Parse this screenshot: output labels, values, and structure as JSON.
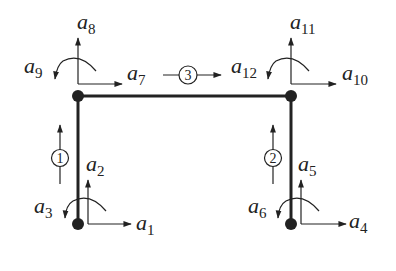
{
  "diagram": {
    "type": "plane frame degrees of freedom",
    "colors": {
      "stroke": "#222222",
      "background": "#ffffff"
    },
    "nodes": [
      {
        "id": "n1",
        "position": "bottom-left"
      },
      {
        "id": "n2",
        "position": "bottom-right"
      },
      {
        "id": "n3",
        "position": "top-left"
      },
      {
        "id": "n4",
        "position": "top-right"
      }
    ],
    "members": [
      {
        "number": "1",
        "from": "n1",
        "to": "n3",
        "direction": "up"
      },
      {
        "number": "2",
        "from": "n2",
        "to": "n4",
        "direction": "up"
      },
      {
        "number": "3",
        "from": "n3",
        "to": "n4",
        "direction": "right"
      }
    ],
    "dof_labels": {
      "a1": {
        "base": "a",
        "sub": "1"
      },
      "a2": {
        "base": "a",
        "sub": "2"
      },
      "a3": {
        "base": "a",
        "sub": "3"
      },
      "a4": {
        "base": "a",
        "sub": "4"
      },
      "a5": {
        "base": "a",
        "sub": "5"
      },
      "a6": {
        "base": "a",
        "sub": "6"
      },
      "a7": {
        "base": "a",
        "sub": "7"
      },
      "a8": {
        "base": "a",
        "sub": "8"
      },
      "a9": {
        "base": "a",
        "sub": "9"
      },
      "a10": {
        "base": "a",
        "sub": "10"
      },
      "a11": {
        "base": "a",
        "sub": "11"
      },
      "a12": {
        "base": "a",
        "sub": "12"
      }
    }
  }
}
